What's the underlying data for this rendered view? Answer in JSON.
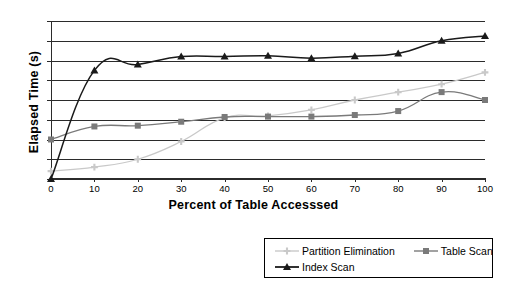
{
  "chart_data": {
    "type": "line",
    "title": "",
    "xlabel": "Percent of Table Accesssed",
    "ylabel": "Elapsed Time (s)",
    "xlim": [
      0,
      100
    ],
    "ylim": [
      0,
      40
    ],
    "xticks": [
      0,
      10,
      20,
      30,
      40,
      50,
      60,
      70,
      80,
      90,
      100
    ],
    "yticks": [
      0,
      5,
      10,
      15,
      20,
      25,
      30,
      35,
      40
    ],
    "grid": "horizontal",
    "legend_position": "bottom-right",
    "x": [
      0,
      10,
      20,
      30,
      40,
      50,
      60,
      70,
      80,
      90,
      100
    ],
    "series": [
      {
        "name": "Partition Elimination",
        "color": "#c9c9c9",
        "marker": "cross",
        "values": [
          2.0,
          3.0,
          5.0,
          9.5,
          15.5,
          16.0,
          17.5,
          20.0,
          22.0,
          24.0,
          27.0
        ]
      },
      {
        "name": "Table Scan",
        "color": "#7a7a7a",
        "marker": "square",
        "values": [
          10.0,
          13.3,
          13.5,
          14.5,
          15.7,
          15.8,
          15.8,
          16.2,
          17.2,
          22.0,
          20.0
        ]
      },
      {
        "name": "Index Scan",
        "color": "#1a1a1a",
        "marker": "triangle",
        "values": [
          0.0,
          27.5,
          29.0,
          31.0,
          31.0,
          31.2,
          30.6,
          31.1,
          31.8,
          35.0,
          36.2
        ]
      }
    ]
  },
  "legend": {
    "items": [
      {
        "label": "Partition Elimination"
      },
      {
        "label": "Table Scan"
      },
      {
        "label": "Index Scan"
      }
    ]
  }
}
